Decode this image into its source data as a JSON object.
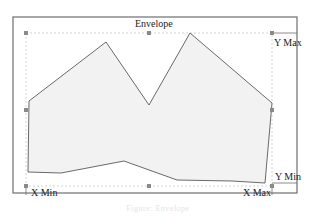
{
  "diagram": {
    "title": "Envelope",
    "labels": {
      "y_max": "Y Max",
      "y_min": "Y Min",
      "x_min": "X Min",
      "x_max": "X Max"
    },
    "caption": "Figure: Envelope",
    "colors": {
      "frame": "#6e6e6e",
      "bbox_dashed": "#c8c8c8",
      "polygon_fill": "#f2f2f2",
      "polygon_stroke": "#6a6a6a",
      "handle_fill": "#8a8a8a",
      "text": "#222222"
    },
    "frame": {
      "x": 13,
      "y": 17,
      "width": 284,
      "height": 176
    },
    "bounding_box": {
      "x_min": 26,
      "y_min": 33,
      "x_max": 272,
      "y_max": 186
    },
    "handles": [
      {
        "name": "top-left",
        "x": 26,
        "y": 33
      },
      {
        "name": "top-center",
        "x": 149,
        "y": 33
      },
      {
        "name": "top-right",
        "x": 272,
        "y": 33
      },
      {
        "name": "middle-left",
        "x": 26,
        "y": 110
      },
      {
        "name": "middle-right",
        "x": 272,
        "y": 110
      },
      {
        "name": "bottom-left",
        "x": 26,
        "y": 186
      },
      {
        "name": "bottom-center",
        "x": 149,
        "y": 186
      },
      {
        "name": "bottom-right",
        "x": 272,
        "y": 186
      }
    ],
    "polygon_points": [
      [
        29,
        101
      ],
      [
        106,
        42
      ],
      [
        149,
        105
      ],
      [
        190,
        33
      ],
      [
        272,
        103
      ],
      [
        265,
        183
      ],
      [
        232,
        181
      ],
      [
        177,
        180
      ],
      [
        124,
        161
      ],
      [
        61,
        173
      ],
      [
        28,
        172
      ]
    ]
  }
}
